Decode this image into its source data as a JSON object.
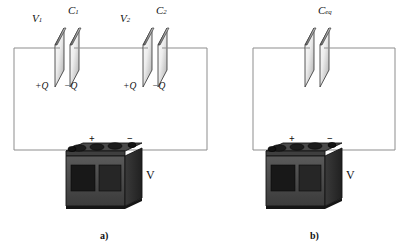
{
  "figure": {
    "background_color": "#ffffff",
    "wire_color": "#8a8a8a",
    "ink_color": "#111111"
  },
  "panels": [
    {
      "id": "a",
      "label": "a)",
      "label_x": 100,
      "label_y": 231,
      "circuit": {
        "left": 14,
        "right": 207,
        "top": 48,
        "bottom": 150
      },
      "capacitors": [
        {
          "name": "C1",
          "voltage_label": "V",
          "voltage_sub": "1",
          "cap_label": "C",
          "cap_sub": "1",
          "plate_pos_label": "+Q",
          "plate_neg_label": "−Q",
          "x": 55,
          "y": 48
        },
        {
          "name": "C2",
          "voltage_label": "V",
          "voltage_sub": "2",
          "cap_label": "C",
          "cap_sub": "2",
          "plate_pos_label": "+Q",
          "plate_neg_label": "−Q",
          "x": 143,
          "y": 48
        }
      ],
      "battery": {
        "name": "battery",
        "plus_label": "+",
        "minus_label": "−",
        "voltage_label": "V",
        "x": 66,
        "y": 143
      }
    },
    {
      "id": "b",
      "label": "b)",
      "label_x": 310,
      "label_y": 231,
      "circuit": {
        "left": 253,
        "right": 395,
        "top": 48,
        "bottom": 150
      },
      "capacitors": [
        {
          "name": "Ceq",
          "voltage_label": "",
          "voltage_sub": "",
          "cap_label": "C",
          "cap_sub": "eq",
          "plate_pos_label": "",
          "plate_neg_label": "",
          "x": 305,
          "y": 48
        }
      ],
      "battery": {
        "name": "battery",
        "plus_label": "+",
        "minus_label": "−",
        "voltage_label": "V",
        "x": 266,
        "y": 143
      }
    }
  ],
  "labels": {
    "a_cap1_v": "V",
    "a_cap1_v_sub": "1",
    "a_cap1_c": "C",
    "a_cap1_c_sub": "1",
    "a_cap1_pos": "+Q",
    "a_cap1_neg": "−Q",
    "a_cap2_v": "V",
    "a_cap2_v_sub": "2",
    "a_cap2_c": "C",
    "a_cap2_c_sub": "2",
    "a_cap2_pos": "+Q",
    "a_cap2_neg": "−Q",
    "a_batt_plus": "+",
    "a_batt_minus": "−",
    "a_batt_v": "V",
    "a_panel": "a)",
    "b_cap_c": "C",
    "b_cap_c_sub": "eq",
    "b_batt_plus": "+",
    "b_batt_minus": "−",
    "b_batt_v": "V",
    "b_panel": "b)"
  }
}
